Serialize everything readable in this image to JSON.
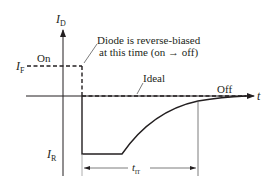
{
  "diagram": {
    "type": "diode-reverse-recovery-waveform",
    "axes": {
      "y_label_main": "I",
      "y_label_sub": "D",
      "x_label": "t"
    },
    "levels": {
      "forward_label_main": "I",
      "forward_label_sub": "F",
      "reverse_label_main": "I",
      "reverse_label_sub": "R"
    },
    "annotations": {
      "on_state": "On",
      "off_state": "Off",
      "ideal": "Ideal",
      "callout_line1": "Diode is reverse-biased",
      "callout_line2": "at this time (on → off)",
      "recovery_time_main": "t",
      "recovery_time_sub": "rr"
    },
    "colors": {
      "ink": "#231f20",
      "thin": "#5a5a5a",
      "background": "#ffffff"
    }
  }
}
